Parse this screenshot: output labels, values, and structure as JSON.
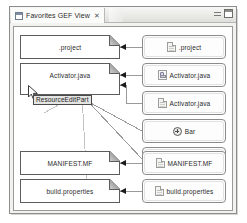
{
  "window": {
    "tab_label": "Favorites GEF View",
    "tab_icon": "view-icon",
    "tab_close_glyph": "✕",
    "minimize_label": "minimize-control",
    "maximize_label": "maximize-control"
  },
  "tooltip": {
    "text": "ResourceEditPart"
  },
  "cursor": {
    "name": "mouse-pointer"
  },
  "diagram": {
    "left_nodes": [
      {
        "label": ".project"
      },
      {
        "label": "Activator.java"
      },
      {
        "label": "MANIFEST.MF"
      },
      {
        "label": "build.properties"
      }
    ],
    "right_nodes": [
      {
        "label": ".project",
        "icon": "file-icon"
      },
      {
        "label": "Activator.java",
        "icon": "java-file-icon"
      },
      {
        "label": "Activator.java",
        "icon": "file-icon"
      },
      {
        "label": "Bar",
        "icon": "class-icon"
      },
      {
        "label": "Foo",
        "icon": "class-icon"
      },
      {
        "label": "MANIFEST.MF",
        "icon": "file-icon"
      },
      {
        "label": "build.properties",
        "icon": "file-icon"
      }
    ]
  },
  "colors": {
    "canvas": "#ffffff",
    "node_border": "#5c5c5c",
    "round_node_border": "#8c8c8c",
    "edge": "#9a9a98",
    "tooltip_bg": "#e4e4e2",
    "window_chrome": "#e9e9e6"
  }
}
